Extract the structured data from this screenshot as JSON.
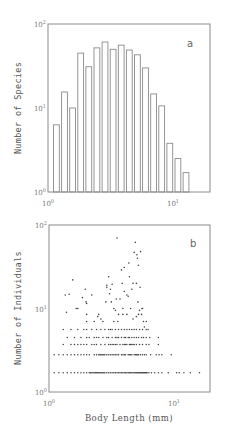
{
  "chart_data": [
    {
      "panel": "a",
      "type": "bar",
      "title": "",
      "panel_label": "a",
      "xlabel": "",
      "ylabel": "Number of Species",
      "xscale": "log",
      "yscale": "log",
      "xlim": [
        1,
        20
      ],
      "ylim": [
        1,
        100
      ],
      "x_ticks": [
        {
          "base": "10",
          "exp": "0",
          "value": 1
        },
        {
          "base": "10",
          "exp": "1",
          "value": 10
        }
      ],
      "y_ticks": [
        {
          "base": "10",
          "exp": "0",
          "value": 1
        },
        {
          "base": "10",
          "exp": "1",
          "value": 10
        },
        {
          "base": "10",
          "exp": "2",
          "value": 100
        }
      ],
      "grid": false,
      "categories": [
        1.12,
        1.26,
        1.41,
        1.58,
        1.78,
        2.0,
        2.24,
        2.51,
        2.82,
        3.16,
        3.55,
        3.98,
        4.47,
        5.01,
        5.62,
        6.31,
        7.08
      ],
      "values": [
        6.3,
        15.5,
        10,
        45,
        31,
        52,
        61,
        50,
        56,
        49,
        43,
        30,
        14.7,
        10.6,
        3.8,
        2.5,
        1.7
      ]
    },
    {
      "panel": "b",
      "type": "scatter",
      "title": "",
      "panel_label": "b",
      "xlabel": "Body Length (mm)",
      "ylabel": "Number of Individuals",
      "xscale": "log",
      "yscale": "log",
      "xlim": [
        1,
        20
      ],
      "ylim": [
        1,
        100
      ],
      "x_ticks": [
        {
          "base": "10",
          "exp": "0",
          "value": 1
        },
        {
          "base": "10",
          "exp": "1",
          "value": 10
        }
      ],
      "y_ticks": [
        {
          "base": "10",
          "exp": "0",
          "value": 1
        },
        {
          "base": "10",
          "exp": "1",
          "value": 10
        },
        {
          "base": "10",
          "exp": "2",
          "value": 100
        }
      ],
      "grid": false,
      "rows": [
        {
          "y": 1.7,
          "x": [
            1.1,
            1.2,
            1.3,
            1.4,
            1.5,
            1.6,
            1.7,
            1.8,
            1.9,
            2.0,
            2.1,
            2.15,
            2.2,
            2.25,
            2.3,
            2.35,
            2.4,
            2.45,
            2.5,
            2.55,
            2.6,
            2.65,
            2.7,
            2.75,
            2.8,
            2.9,
            3.0,
            3.1,
            3.2,
            3.3,
            3.4,
            3.5,
            3.6,
            3.7,
            3.8,
            3.9,
            4.0,
            4.1,
            4.2,
            4.3,
            4.4,
            4.5,
            4.6,
            4.7,
            4.8,
            4.9,
            5.0,
            5.1,
            5.2,
            5.3,
            5.4,
            5.5,
            5.6,
            5.7,
            5.8,
            5.9,
            6.0,
            6.1,
            6.3,
            6.6,
            7.0,
            7.5,
            8.0,
            9.0,
            10.5,
            11.0,
            12.0,
            13.5,
            16.0
          ]
        },
        {
          "y": 2.8,
          "x": [
            1.1,
            1.2,
            1.3,
            1.4,
            1.5,
            1.6,
            1.7,
            1.8,
            1.9,
            2.0,
            2.1,
            2.3,
            2.4,
            2.5,
            2.55,
            2.6,
            2.65,
            2.7,
            2.75,
            2.8,
            2.9,
            3.0,
            3.1,
            3.2,
            3.3,
            3.4,
            3.5,
            3.6,
            3.8,
            3.9,
            4.0,
            4.1,
            4.3,
            4.4,
            4.5,
            4.6,
            4.8,
            4.9,
            5.0,
            5.1,
            5.2,
            5.4,
            5.6,
            5.8,
            6.0,
            6.5,
            7.2,
            7.6,
            8.0,
            9.5
          ]
        },
        {
          "y": 3.7,
          "x": [
            1.3,
            1.5,
            1.6,
            1.7,
            1.8,
            1.9,
            2.0,
            2.2,
            2.3,
            2.4,
            2.6,
            2.8,
            3.0,
            3.1,
            3.2,
            3.3,
            3.4,
            3.5,
            3.7,
            3.9,
            4.0,
            4.1,
            4.2,
            4.4,
            4.5,
            4.6,
            4.7,
            4.8,
            5.0,
            5.3,
            5.6,
            6.0,
            6.3,
            7.5
          ]
        },
        {
          "y": 4.5,
          "x": [
            1.4,
            1.6,
            1.8,
            2.0,
            2.1,
            2.3,
            2.4,
            2.5,
            2.7,
            2.9,
            3.0,
            3.2,
            3.4,
            3.5,
            3.6,
            3.8,
            4.0,
            4.1,
            4.3,
            4.4,
            4.6,
            4.8,
            5.0,
            5.2,
            5.5,
            5.7,
            6.0,
            6.4,
            7.5
          ]
        },
        {
          "y": 5.6,
          "x": [
            1.3,
            1.5,
            1.7,
            1.9,
            2.0,
            2.2,
            2.4,
            2.6,
            2.8,
            3.0,
            3.1,
            3.2,
            3.4,
            3.6,
            3.8,
            4.0,
            4.2,
            4.4,
            4.6,
            4.8,
            5.0,
            5.3,
            5.6,
            6.0,
            6.2
          ]
        }
      ],
      "points": [
        [
          1.35,
          14.5
        ],
        [
          1.45,
          14.8
        ],
        [
          1.55,
          22
        ],
        [
          1.38,
          9
        ],
        [
          1.65,
          10
        ],
        [
          1.7,
          10
        ],
        [
          1.85,
          13.5
        ],
        [
          1.95,
          17
        ],
        [
          2.0,
          11.5
        ],
        [
          1.98,
          12
        ],
        [
          2.0,
          8.5
        ],
        [
          2.0,
          7
        ],
        [
          2.2,
          14.5
        ],
        [
          2.3,
          7
        ],
        [
          2.45,
          8
        ],
        [
          2.5,
          8.5
        ],
        [
          2.6,
          7.5
        ],
        [
          2.7,
          7
        ],
        [
          2.85,
          12
        ],
        [
          2.9,
          19
        ],
        [
          2.9,
          18
        ],
        [
          3.0,
          24
        ],
        [
          3.05,
          15
        ],
        [
          3.1,
          17
        ],
        [
          3.2,
          19.5
        ],
        [
          3.15,
          12
        ],
        [
          3.3,
          10
        ],
        [
          3.4,
          9.5
        ],
        [
          3.5,
          70
        ],
        [
          3.45,
          13
        ],
        [
          3.55,
          7
        ],
        [
          3.6,
          8.5
        ],
        [
          3.7,
          13
        ],
        [
          3.8,
          29
        ],
        [
          3.85,
          20
        ],
        [
          3.9,
          10
        ],
        [
          4.0,
          31
        ],
        [
          4.0,
          16
        ],
        [
          4.2,
          14.5
        ],
        [
          4.3,
          14
        ],
        [
          4.35,
          35
        ],
        [
          4.4,
          24
        ],
        [
          4.5,
          10
        ],
        [
          4.6,
          17
        ],
        [
          4.7,
          20
        ],
        [
          4.8,
          47
        ],
        [
          4.9,
          62
        ],
        [
          5.0,
          20
        ],
        [
          5.05,
          44
        ],
        [
          5.1,
          40
        ],
        [
          5.15,
          12
        ],
        [
          5.2,
          33
        ],
        [
          5.3,
          9.5
        ],
        [
          5.35,
          18
        ],
        [
          5.4,
          48
        ],
        [
          5.5,
          8.5
        ],
        [
          5.55,
          10
        ],
        [
          5.6,
          10
        ],
        [
          5.7,
          7
        ],
        [
          5.8,
          6
        ],
        [
          6.0,
          7
        ],
        [
          4.7,
          7.5
        ],
        [
          5.0,
          8
        ],
        [
          5.2,
          8.5
        ],
        [
          4.2,
          8.5
        ],
        [
          3.9,
          8.5
        ],
        [
          3.3,
          7
        ]
      ]
    }
  ]
}
